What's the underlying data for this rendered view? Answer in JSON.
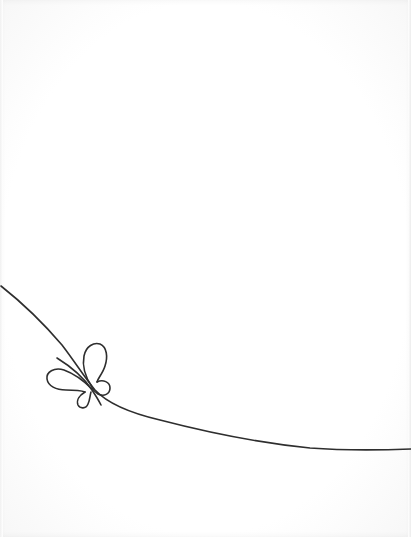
{
  "illustration": {
    "title": "Line-art butterfly on a flowing curve",
    "background_color": "#ffffff",
    "stroke_color": "#2e2e2e",
    "stroke_width": 1.6,
    "elements": [
      {
        "name": "flowing-curve",
        "description": "Single continuous line sweeping from upper-left down and right to the right edge"
      },
      {
        "name": "butterfly",
        "description": "Minimal outline butterfly with four looped wings and a diagonal antenna, perched on the curve"
      }
    ]
  }
}
